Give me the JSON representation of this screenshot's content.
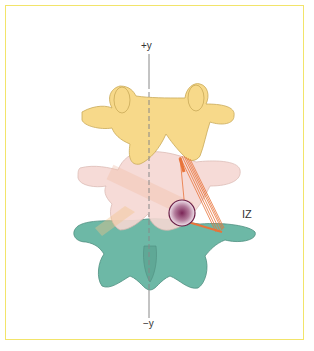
{
  "figure": {
    "axis": {
      "top_label": "+y",
      "bottom_label": "−y"
    },
    "annotation": {
      "label": "IZ"
    },
    "colors": {
      "frame": "#f2e46a",
      "upper_vertebra": "#f7d98a",
      "middle_vertebra": "#f6d8d3",
      "lower_vertebra": "#6db8a6",
      "ligament_lines": "#e8743a",
      "circle_fill": "#8a3a6a",
      "axis_line": "#888888"
    }
  }
}
